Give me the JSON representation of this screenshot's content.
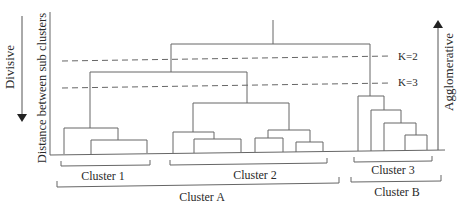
{
  "diagram": {
    "type": "dendrogram",
    "left_arrow_label": "Divisive",
    "right_arrow_label": "Agglomerative",
    "y_axis_label": "Distance between sub clusters",
    "cut_lines": [
      {
        "label": "K=2"
      },
      {
        "label": "K=3"
      }
    ],
    "clusters": {
      "c1": "Cluster 1",
      "c2": "Cluster 2",
      "c3": "Cluster 3",
      "ca": "Cluster A",
      "cb": "Cluster B"
    },
    "colors": {
      "line": "#555555",
      "text": "#2a2a2a",
      "background": "#ffffff"
    }
  }
}
